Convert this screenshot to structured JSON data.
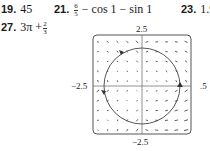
{
  "answers": [
    {
      "number": "19.",
      "text": "45"
    },
    {
      "number": "21.",
      "frac_num": "6",
      "frac_den": "5",
      "rest": "− cos 1 − sin 1"
    },
    {
      "number": "23.",
      "text": "1.9"
    },
    {
      "number": "27.",
      "lead": "3π +",
      "frac_num": "2",
      "frac_den": "3"
    }
  ],
  "chart_data": {
    "type": "vector_field",
    "title": "",
    "xlabel": "",
    "ylabel": "",
    "xlim": [
      -2.5,
      2.5
    ],
    "ylim": [
      -2.5,
      2.5
    ],
    "tick_labels": {
      "top": "2.5",
      "bottom": "−2.5",
      "left": "−2.5",
      "right": ".5"
    },
    "grid": false,
    "curve": {
      "shape": "circle",
      "center": [
        0,
        0
      ],
      "radius": 2.0,
      "orientation": "counterclockwise",
      "arrow_markers": [
        "top",
        "left",
        "right"
      ]
    },
    "field_notes": "Arrows point up-left in upper-left quadrant, up in lower-left, down-right in lower-right, up in upper-right; near-zero magnitude near origin"
  }
}
